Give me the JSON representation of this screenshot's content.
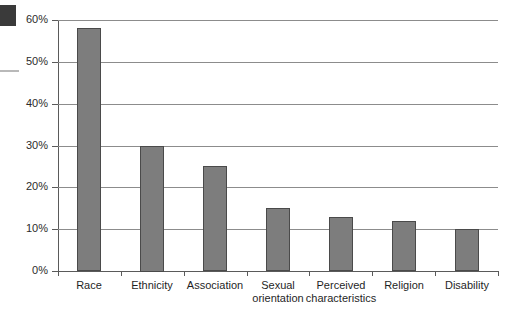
{
  "artifacts": {
    "corner_block": "scan-artifact-dark-block",
    "edge_line": "scan-artifact-gray-line"
  },
  "chart_data": {
    "type": "bar",
    "title": "",
    "xlabel": "",
    "ylabel": "",
    "ylim": [
      0,
      60
    ],
    "grid": true,
    "legend": "none",
    "categories": [
      "Race",
      "Sexual orientation",
      "Ethnicity",
      "Association",
      "Perceived characteristics",
      "Religion",
      "Disability"
    ],
    "bars": [
      {
        "label": "Race",
        "label_line1": "Race",
        "label_line2": "",
        "value": 58,
        "value_label": "58%"
      },
      {
        "label": "Ethnicity",
        "label_line1": "Ethnicity",
        "label_line2": "",
        "value": 30,
        "value_label": "30%"
      },
      {
        "label": "Association",
        "label_line1": "Association",
        "label_line2": "",
        "value": 25,
        "value_label": "25%"
      },
      {
        "label": "Sexual orientation",
        "label_line1": "Sexual",
        "label_line2": "orientation",
        "value": 15,
        "value_label": "15%"
      },
      {
        "label": "Perceived characteristics",
        "label_line1": "Perceived",
        "label_line2": "characteristics",
        "value": 13,
        "value_label": "13%"
      },
      {
        "label": "Religion",
        "label_line1": "Religion",
        "label_line2": "",
        "value": 12,
        "value_label": "12%"
      },
      {
        "label": "Disability",
        "label_line1": "Disability",
        "label_line2": "",
        "value": 10,
        "value_label": "10%"
      }
    ],
    "values": [
      58,
      30,
      25,
      15,
      13,
      12,
      10
    ],
    "yticks": [
      0,
      10,
      20,
      30,
      40,
      50,
      60
    ],
    "ytick_labels": [
      "0%",
      "10%",
      "20%",
      "30%",
      "40%",
      "50%",
      "60%"
    ],
    "colors": {
      "bar_fill": "#7d7d7d",
      "bar_stroke": "#4a4a4a",
      "gridline": "#8c8c8c",
      "axis": "#5a5a5a",
      "text": "#1f1f1f",
      "background": "#ffffff"
    }
  }
}
